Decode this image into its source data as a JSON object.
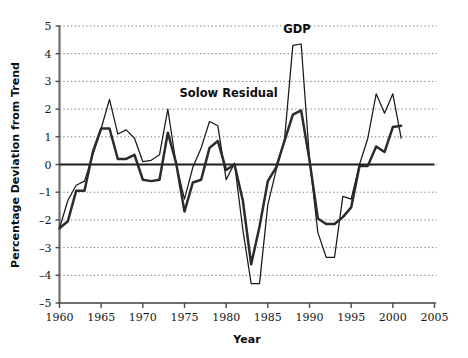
{
  "chart_data": {
    "type": "line",
    "title": "",
    "xlabel": "Year",
    "ylabel": "Percentage Deviation from Trend",
    "xlim": [
      1960,
      2005
    ],
    "ylim": [
      -5,
      5
    ],
    "grid": true,
    "legend_position": "inline-annotation",
    "x_ticks": [
      "1960",
      "1965",
      "1970",
      "1975",
      "1980",
      "1985",
      "1990",
      "1995",
      "2000",
      "2005"
    ],
    "x_tick_values": [
      1960,
      1965,
      1970,
      1975,
      1980,
      1985,
      1990,
      1995,
      2000,
      2005
    ],
    "y_ticks": [
      "5",
      "4",
      "3",
      "2",
      "1",
      "0",
      "–1",
      "–2",
      "–3",
      "–4",
      "–5"
    ],
    "y_tick_values": [
      5,
      4,
      3,
      2,
      1,
      0,
      -1,
      -2,
      -3,
      -4,
      -5
    ],
    "annotations": [
      {
        "text": "Solow Residual",
        "x": 1980.3,
        "y": 2.45
      },
      {
        "text": "GDP",
        "x": 1988.5,
        "y": 4.75
      }
    ],
    "x": [
      1960,
      1961,
      1962,
      1963,
      1964,
      1965,
      1966,
      1967,
      1968,
      1969,
      1970,
      1971,
      1972,
      1973,
      1974,
      1975,
      1976,
      1977,
      1978,
      1979,
      1980,
      1981,
      1982,
      1983,
      1984,
      1985,
      1986,
      1987,
      1988,
      1989,
      1990,
      1991,
      1992,
      1993,
      1994,
      1995,
      1996,
      1997,
      1998,
      1999,
      2000,
      2001
    ],
    "series": [
      {
        "name": "GDP",
        "color": "#1a1a1a",
        "width": 1.25,
        "values": [
          -2.3,
          -1.3,
          -0.75,
          -0.6,
          0.35,
          1.3,
          2.35,
          1.1,
          1.25,
          0.95,
          0.1,
          0.15,
          0.35,
          2.0,
          0.0,
          -1.25,
          -0.1,
          0.6,
          1.55,
          1.4,
          -0.55,
          0.05,
          -2.35,
          -4.3,
          -4.3,
          -1.45,
          -0.2,
          0.9,
          4.3,
          4.35,
          0.2,
          -2.45,
          -3.35,
          -3.35,
          -1.15,
          -1.25,
          0.0,
          0.95,
          2.55,
          1.85,
          2.55,
          0.95
        ]
      },
      {
        "name": "Solow Residual",
        "color": "#2b2b2b",
        "width": 2.5,
        "values": [
          -2.3,
          -2.05,
          -0.95,
          -0.95,
          0.45,
          1.3,
          1.3,
          0.2,
          0.2,
          0.35,
          -0.55,
          -0.6,
          -0.55,
          1.15,
          0.05,
          -1.7,
          -0.65,
          -0.55,
          0.6,
          0.85,
          -0.2,
          0.0,
          -1.3,
          -3.6,
          -2.25,
          -0.6,
          -0.1,
          0.85,
          1.8,
          1.95,
          0.15,
          -1.95,
          -2.15,
          -2.15,
          -1.9,
          -1.55,
          -0.05,
          -0.05,
          0.65,
          0.45,
          1.35,
          1.4
        ]
      }
    ]
  }
}
